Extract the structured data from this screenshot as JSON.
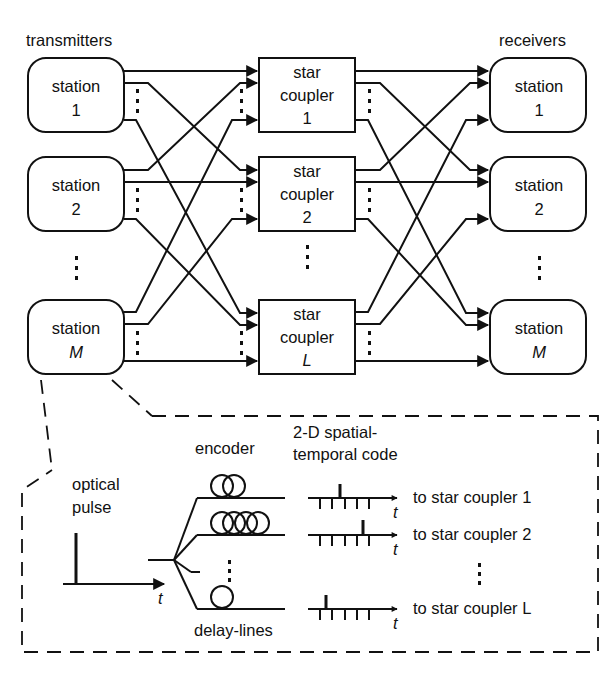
{
  "labels": {
    "transmitters": "transmitters",
    "receivers": "receivers",
    "optical_pulse_line1": "optical",
    "optical_pulse_line2": "pulse",
    "encoder": "encoder",
    "code_line1": "2-D spatial-",
    "code_line2": "temporal code",
    "delay_lines": "delay-lines",
    "time_axis": "t"
  },
  "transmitters": [
    {
      "line1": "station",
      "line2": "1"
    },
    {
      "line1": "station",
      "line2": "2"
    },
    {
      "line1": "station",
      "line2": "M"
    }
  ],
  "couplers": [
    {
      "line1": "star",
      "line2": "coupler",
      "line3": "1"
    },
    {
      "line1": "star",
      "line2": "coupler",
      "line3": "2"
    },
    {
      "line1": "star",
      "line2": "coupler",
      "line3": "L"
    }
  ],
  "receivers": [
    {
      "line1": "station",
      "line2": "1"
    },
    {
      "line1": "station",
      "line2": "2"
    },
    {
      "line1": "station",
      "line2": "M"
    }
  ],
  "outputs": [
    {
      "label": "to star coupler 1",
      "pulse_slot": 2
    },
    {
      "label": "to star coupler 2",
      "pulse_slot": 5
    },
    {
      "label": "to star coupler L",
      "pulse_slot": 1
    }
  ],
  "encoder_coils": [
    2,
    4,
    1
  ],
  "colors": {
    "line": "#111111",
    "background": "#ffffff"
  }
}
